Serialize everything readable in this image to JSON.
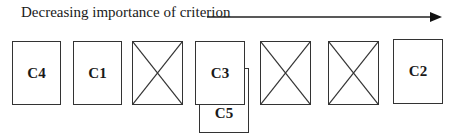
{
  "header": {
    "label": "Decreasing importance of criterion"
  },
  "arrow": {
    "direction": "right",
    "x1": 207,
    "x2": 440,
    "y": 17
  },
  "boxes": [
    {
      "id": "C4",
      "label": "C4",
      "empty": false
    },
    {
      "id": "C1",
      "label": "C1",
      "empty": false
    },
    {
      "id": "empty-1",
      "label": "",
      "empty": true
    },
    {
      "id": "C3",
      "label": "C3",
      "empty": false
    },
    {
      "id": "empty-2",
      "label": "",
      "empty": true
    },
    {
      "id": "empty-3",
      "label": "",
      "empty": true
    },
    {
      "id": "C2",
      "label": "C2",
      "empty": false
    }
  ],
  "overlap_box": {
    "id": "C5",
    "label": "C5",
    "under": "C3"
  },
  "colors": {
    "stroke": "#333333",
    "background": "#ffffff",
    "text": "#1a1a1a"
  }
}
